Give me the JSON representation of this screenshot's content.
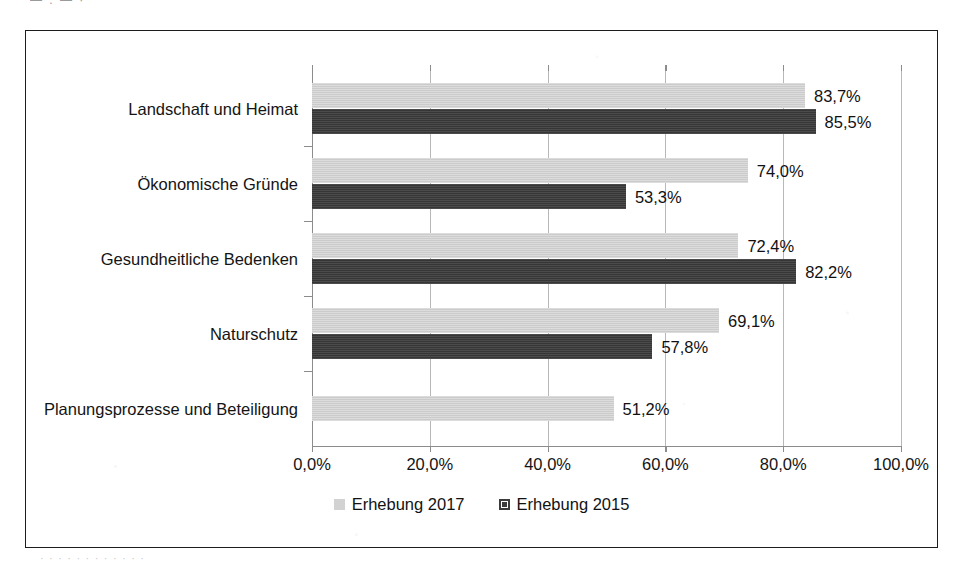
{
  "artifacts": {
    "top_partial_text": "— . —  ·",
    "bottom_partial_text": "·  ·   ·    ·     ·      ·       ·        ·         ·          ·           ·            ·"
  },
  "colors": {
    "series_2017": "#d2d2d2",
    "series_2015": "#3c3c3c",
    "frame_border": "#1c1c1c",
    "gridline": "#b8b8b8",
    "axis": "#8c8c8c",
    "text": "#141414",
    "background": "#ffffff"
  },
  "legend": {
    "position": "bottom-center",
    "entries": [
      {
        "label": "Erhebung 2017",
        "swatch": "series_2017"
      },
      {
        "label": "Erhebung 2015",
        "swatch": "series_2015"
      }
    ]
  },
  "chart_data": {
    "type": "bar",
    "orientation": "horizontal",
    "title": "",
    "subtitle": "",
    "xlabel": "",
    "ylabel": "",
    "xlim": [
      0,
      100
    ],
    "xtick_labels": [
      "0,0%",
      "20,0%",
      "40,0%",
      "60,0%",
      "80,0%",
      "100,0%"
    ],
    "xticks": [
      0,
      20,
      40,
      60,
      80,
      100
    ],
    "grid": "vertical",
    "categories": [
      "Landschaft und Heimat",
      "Ökonomische Gründe",
      "Gesundheitliche Bedenken",
      "Naturschutz",
      "Planungsprozesse und Beteiligung"
    ],
    "series": [
      {
        "name": "Erhebung 2017",
        "color": "#d2d2d2",
        "values": [
          83.7,
          74.0,
          72.4,
          69.1,
          51.2
        ],
        "labels": [
          "83,7%",
          "74,0%",
          "72,4%",
          "69,1%",
          "51,2%"
        ]
      },
      {
        "name": "Erhebung 2015",
        "color": "#3c3c3c",
        "values": [
          85.5,
          53.3,
          82.2,
          57.8,
          null
        ],
        "labels": [
          "85,5%",
          "53,3%",
          "82,2%",
          "57,8%",
          null
        ]
      }
    ]
  }
}
